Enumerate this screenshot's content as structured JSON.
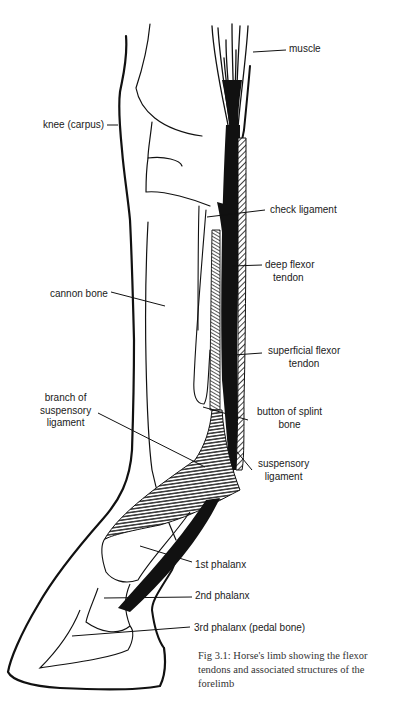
{
  "figure": {
    "labels": {
      "muscle": "muscle",
      "knee": "knee (carpus)",
      "check_ligament": "check ligament",
      "deep_flexor_1": "deep flexor",
      "deep_flexor_2": "tendon",
      "cannon_bone": "cannon bone",
      "superficial_flexor_1": "superficial flexor",
      "superficial_flexor_2": "tendon",
      "branch_1": "branch of",
      "branch_2": "suspensory",
      "branch_3": "ligament",
      "button_1": "button of splint",
      "button_2": "bone",
      "suspensory_1": "suspensory",
      "suspensory_2": "ligament",
      "phalanx1": "1st phalanx",
      "phalanx2": "2nd phalanx",
      "phalanx3": "3rd phalanx (pedal bone)"
    },
    "caption": "Fig 3.1: Horse's limb showing the flexor tendons and associated structures of the forelimb",
    "colors": {
      "ink": "#111111",
      "background": "#ffffff"
    }
  }
}
